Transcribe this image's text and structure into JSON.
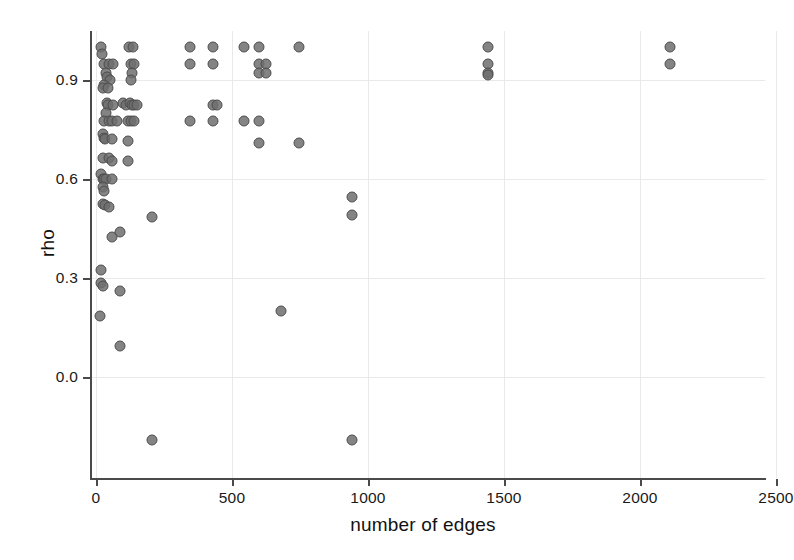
{
  "chart_data": {
    "type": "scatter",
    "title": "",
    "xlabel": "number of edges",
    "ylabel": "rho",
    "xlim": [
      -60,
      2880
    ],
    "ylim": [
      -0.22,
      1.07
    ],
    "grid": true,
    "legend": null,
    "xticks": [
      0,
      500,
      1000,
      1500,
      2000,
      2500
    ],
    "xticklabels": [
      "0",
      "500",
      "1000",
      "1500",
      "2000",
      "2500"
    ],
    "yticks": [
      0.0,
      0.3,
      0.6,
      0.9
    ],
    "yticklabels": [
      "0.0",
      "0.3",
      "0.6",
      "0.9"
    ],
    "marker": {
      "shape": "circle",
      "size_px": 11,
      "fill_color": "#6e6e6e",
      "edge_color": "#4d4d4d",
      "opacity": 0.85
    },
    "points": [
      [
        20,
        1.0
      ],
      [
        22,
        0.98
      ],
      [
        30,
        0.95
      ],
      [
        48,
        0.95
      ],
      [
        62,
        0.95
      ],
      [
        120,
        1.0
      ],
      [
        135,
        1.0
      ],
      [
        128,
        0.95
      ],
      [
        140,
        0.95
      ],
      [
        132,
        0.92
      ],
      [
        130,
        0.9
      ],
      [
        36,
        0.92
      ],
      [
        40,
        0.91
      ],
      [
        52,
        0.9
      ],
      [
        30,
        0.885
      ],
      [
        24,
        0.875
      ],
      [
        44,
        0.875
      ],
      [
        345,
        1.0
      ],
      [
        345,
        0.95
      ],
      [
        430,
        1.0
      ],
      [
        430,
        0.95
      ],
      [
        545,
        1.0
      ],
      [
        600,
        1.0
      ],
      [
        600,
        0.95
      ],
      [
        625,
        0.95
      ],
      [
        600,
        0.92
      ],
      [
        625,
        0.92
      ],
      [
        745,
        1.0
      ],
      [
        1440,
        1.0
      ],
      [
        1440,
        0.95
      ],
      [
        1440,
        0.92
      ],
      [
        1440,
        0.915
      ],
      [
        2110,
        1.0
      ],
      [
        2110,
        0.95
      ],
      [
        2720,
        1.0
      ],
      [
        2720,
        0.95
      ],
      [
        40,
        0.83
      ],
      [
        45,
        0.825
      ],
      [
        62,
        0.825
      ],
      [
        100,
        0.83
      ],
      [
        112,
        0.825
      ],
      [
        125,
        0.83
      ],
      [
        132,
        0.825
      ],
      [
        140,
        0.825
      ],
      [
        150,
        0.825
      ],
      [
        38,
        0.8
      ],
      [
        430,
        0.825
      ],
      [
        445,
        0.825
      ],
      [
        28,
        0.775
      ],
      [
        48,
        0.775
      ],
      [
        60,
        0.775
      ],
      [
        78,
        0.775
      ],
      [
        118,
        0.775
      ],
      [
        128,
        0.775
      ],
      [
        140,
        0.775
      ],
      [
        345,
        0.775
      ],
      [
        430,
        0.775
      ],
      [
        545,
        0.775
      ],
      [
        600,
        0.775
      ],
      [
        26,
        0.735
      ],
      [
        30,
        0.725
      ],
      [
        34,
        0.72
      ],
      [
        58,
        0.72
      ],
      [
        118,
        0.715
      ],
      [
        600,
        0.71
      ],
      [
        745,
        0.71
      ],
      [
        26,
        0.665
      ],
      [
        46,
        0.665
      ],
      [
        60,
        0.655
      ],
      [
        118,
        0.655
      ],
      [
        20,
        0.615
      ],
      [
        26,
        0.6
      ],
      [
        30,
        0.6
      ],
      [
        36,
        0.6
      ],
      [
        58,
        0.6
      ],
      [
        24,
        0.575
      ],
      [
        30,
        0.565
      ],
      [
        26,
        0.525
      ],
      [
        32,
        0.52
      ],
      [
        48,
        0.515
      ],
      [
        940,
        0.545
      ],
      [
        205,
        0.485
      ],
      [
        940,
        0.49
      ],
      [
        60,
        0.425
      ],
      [
        88,
        0.44
      ],
      [
        20,
        0.325
      ],
      [
        18,
        0.285
      ],
      [
        26,
        0.275
      ],
      [
        90,
        0.26
      ],
      [
        680,
        0.2
      ],
      [
        16,
        0.185
      ],
      [
        88,
        0.095
      ],
      [
        205,
        -0.19
      ],
      [
        940,
        -0.19
      ]
    ]
  }
}
